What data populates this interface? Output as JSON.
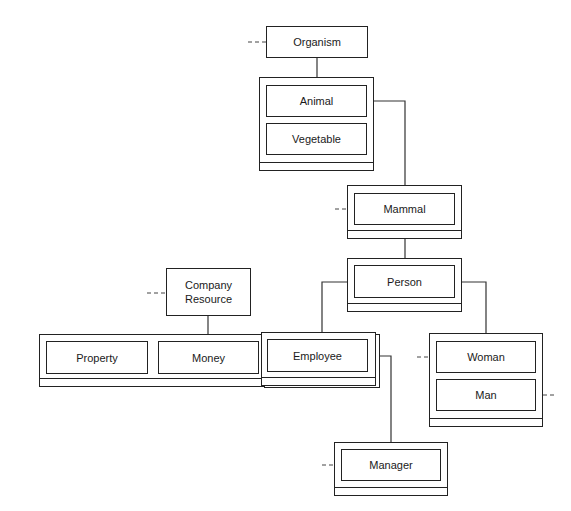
{
  "diagram": {
    "type": "object-class hierarchy",
    "nodes": {
      "organism": {
        "label": "Organism"
      },
      "animal": {
        "label": "Animal"
      },
      "vegetable": {
        "label": "Vegetable"
      },
      "mammal": {
        "label": "Mammal"
      },
      "person": {
        "label": "Person"
      },
      "company_resource": {
        "label": "Company Resource"
      },
      "property": {
        "label": "Property"
      },
      "money": {
        "label": "Money"
      },
      "employee": {
        "label": "Employee"
      },
      "woman": {
        "label": "Woman"
      },
      "man": {
        "label": "Man"
      },
      "manager": {
        "label": "Manager"
      }
    },
    "edges": [
      {
        "from": "Organism",
        "to": "Animal/Vegetable group",
        "style": "solid"
      },
      {
        "from": "Animal",
        "to": "Mammal",
        "style": "solid"
      },
      {
        "from": "Mammal",
        "to": "Person",
        "style": "solid"
      },
      {
        "from": "Person",
        "to": "Employee",
        "style": "solid"
      },
      {
        "from": "Person",
        "to": "Woman/Man group",
        "style": "solid"
      },
      {
        "from": "Company Resource",
        "to": "Property/Money/Employee group",
        "style": "solid"
      },
      {
        "from": "Employee",
        "to": "Manager",
        "style": "solid"
      }
    ],
    "external_stubs": [
      "Organism",
      "Mammal",
      "Company Resource",
      "Woman",
      "Man",
      "Manager"
    ]
  }
}
